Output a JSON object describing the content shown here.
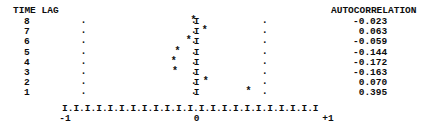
{
  "left_header": "TIME LAG",
  "right_header": "AUTOCORRELATION",
  "rows": [
    {
      "lag": "8",
      "acf_text": "-0.023",
      "acf": -0.023
    },
    {
      "lag": "7",
      "acf_text": " 0.063",
      "acf": 0.063
    },
    {
      "lag": "6",
      "acf_text": "-0.059",
      "acf": -0.059
    },
    {
      "lag": "5",
      "acf_text": "-0.144",
      "acf": -0.144
    },
    {
      "lag": "4",
      "acf_text": "-0.172",
      "acf": -0.172
    },
    {
      "lag": "3",
      "acf_text": "-0.163",
      "acf": -0.163
    },
    {
      "lag": "2",
      "acf_text": " 0.070",
      "acf": 0.07
    },
    {
      "lag": "1",
      "acf_text": " 0.395",
      "acf": 0.395
    }
  ],
  "axis": {
    "line": "I.I.I.I.I.I.I.I.I.I.I.I.I.I.I.I.I.I.I.I.I.I.I",
    "tick_labels": [
      {
        "text": "-1",
        "value": -1
      },
      {
        "text": "0",
        "value": 0
      },
      {
        "text": "+1",
        "value": 1
      }
    ]
  },
  "markers": {
    "point_glyph": "*",
    "zero_line_glyph": "I",
    "guide_glyph": "."
  },
  "guide_columns": [
    -0.86,
    -0.02,
    0.52
  ],
  "colors": {
    "ink": "#0d0d0d",
    "paper": "#ffffff"
  },
  "chart_data": {
    "type": "bar",
    "title": "",
    "subtitle": "",
    "xlabel": "AUTOCORRELATION",
    "ylabel": "TIME LAG",
    "orientation": "horizontal",
    "categories": [
      "8",
      "7",
      "6",
      "5",
      "4",
      "3",
      "2",
      "1"
    ],
    "values": [
      -0.023,
      0.063,
      -0.059,
      -0.144,
      -0.172,
      -0.163,
      0.07,
      0.395
    ],
    "xlim": [
      -1,
      1
    ],
    "xticks": [
      -1,
      0,
      1
    ],
    "xticklabels": [
      "-1",
      "0",
      "+1"
    ],
    "grid": false,
    "legend": null
  }
}
